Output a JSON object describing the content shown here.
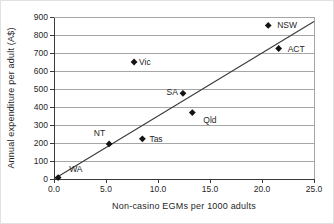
{
  "chart_data": {
    "type": "scatter",
    "title": "",
    "xlabel": "Non-casino EGMs per 1000 adults",
    "ylabel": "Annual expenditure per adult (A$)",
    "xlim": [
      0,
      25
    ],
    "ylim": [
      0,
      900
    ],
    "x_ticks": [
      {
        "v": 0,
        "label": "0.0"
      },
      {
        "v": 5,
        "label": "5.0"
      },
      {
        "v": 10,
        "label": "10.0"
      },
      {
        "v": 15,
        "label": "15.0"
      },
      {
        "v": 20,
        "label": "20.0"
      },
      {
        "v": 25,
        "label": "25.0"
      }
    ],
    "y_ticks": [
      {
        "v": 0,
        "label": "0"
      },
      {
        "v": 100,
        "label": "100"
      },
      {
        "v": 200,
        "label": "200"
      },
      {
        "v": 300,
        "label": "300"
      },
      {
        "v": 400,
        "label": "400"
      },
      {
        "v": 500,
        "label": "500"
      },
      {
        "v": 600,
        "label": "600"
      },
      {
        "v": 700,
        "label": "700"
      },
      {
        "v": 800,
        "label": "800"
      },
      {
        "v": 900,
        "label": "900"
      }
    ],
    "grid": "horizontal",
    "legend": "none",
    "points": [
      {
        "name": "WA",
        "x": 0.4,
        "y": 8,
        "anchor": "start",
        "dx": 11,
        "dy": -9
      },
      {
        "name": "NT",
        "x": 5.3,
        "y": 195,
        "anchor": "end",
        "dx": -4,
        "dy": -11
      },
      {
        "name": "Tas",
        "x": 8.5,
        "y": 223,
        "anchor": "start",
        "dx": 7,
        "dy": 0
      },
      {
        "name": "Vic",
        "x": 7.7,
        "y": 650,
        "anchor": "start",
        "dx": 5,
        "dy": 0
      },
      {
        "name": "SA",
        "x": 12.4,
        "y": 476,
        "anchor": "end",
        "dx": -5,
        "dy": -1
      },
      {
        "name": "Qld",
        "x": 13.3,
        "y": 369,
        "anchor": "start",
        "dx": 11,
        "dy": 7
      },
      {
        "name": "NSW",
        "x": 20.6,
        "y": 853,
        "anchor": "start",
        "dx": 9,
        "dy": 0
      },
      {
        "name": "ACT",
        "x": 21.6,
        "y": 725,
        "anchor": "start",
        "dx": 9,
        "dy": 0
      }
    ],
    "trendline": {
      "x1": 0,
      "y1": 0,
      "x2": 25,
      "y2": 875
    },
    "colors": {
      "marker": "#141414",
      "grid": "#a6a6a6",
      "frame": "#a6a6a6",
      "axis": "#3a3a3a",
      "trend": "#3a3a3a",
      "text": "#1f1f1f",
      "background": "#ffffff"
    }
  }
}
